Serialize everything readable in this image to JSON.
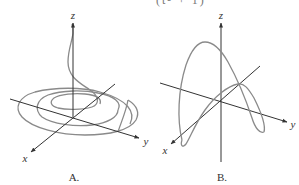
{
  "figure": {
    "top_cut_text": "(t² + 1)",
    "panels": [
      {
        "id": "A",
        "label": "A.",
        "axes": {
          "x": "x",
          "y": "y",
          "z": "z"
        },
        "curve": "spiral descending from z-axis into expanding concentric loops in the xy-plane"
      },
      {
        "id": "B",
        "label": "B.",
        "axes": {
          "x": "x",
          "y": "y",
          "z": "z"
        },
        "curve": "looping arch curve rising above and dipping below the xy-plane"
      }
    ],
    "colors": {
      "axis": "#333333",
      "curve": "#8a8a8a",
      "background": "#ffffff"
    }
  }
}
